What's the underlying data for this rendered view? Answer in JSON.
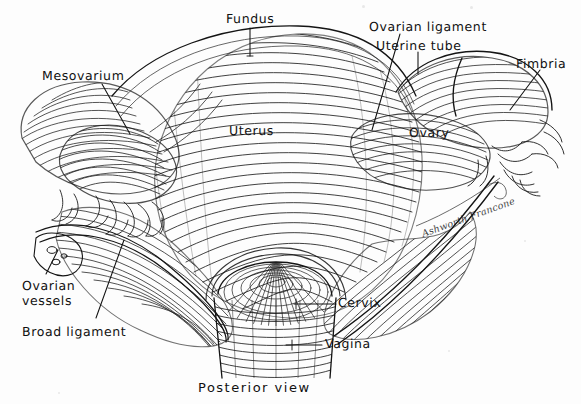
{
  "plate": {
    "title": "Posterior view of uterus, uterine tubes and ovaries",
    "medium": "pen-and-ink anatomical line illustration",
    "ink_color": "#111111",
    "paper_color": "#fdfdfd",
    "width": 581,
    "height": 404
  },
  "caption": {
    "text": "Posterior  view"
  },
  "signature": {
    "text": "Ashworth Francone"
  },
  "labels": [
    {
      "id": "fundus",
      "text": "Fundus",
      "x": 226,
      "y": 12,
      "leader": "vertical-down"
    },
    {
      "id": "mesovarium",
      "text": "Mesovarium",
      "x": 42,
      "y": 69,
      "leader": "diagonal-down-right"
    },
    {
      "id": "ovarian-ligament",
      "text": "Ovarian ligament",
      "x": 369,
      "y": 20,
      "leader": "diagonal-down-left"
    },
    {
      "id": "uterine-tube",
      "text": "Uterine tube",
      "x": 376,
      "y": 39,
      "leader": "vertical-down"
    },
    {
      "id": "fimbria",
      "text": "Fimbria",
      "x": 516,
      "y": 57,
      "leader": "diagonal-down-left"
    },
    {
      "id": "uterus",
      "text": "Uterus",
      "x": 229,
      "y": 124,
      "leader": "none"
    },
    {
      "id": "ovary",
      "text": "Ovary",
      "x": 409,
      "y": 126,
      "leader": "none"
    },
    {
      "id": "ovarian-vessels",
      "text": "Ovarian\nvessels",
      "x": 22,
      "y": 279,
      "leader": "diagonal-up-right"
    },
    {
      "id": "broad-ligament",
      "text": "Broad ligament",
      "x": 22,
      "y": 325,
      "leader": "diagonal-up-right"
    },
    {
      "id": "cervix",
      "text": "Cervix",
      "x": 338,
      "y": 299,
      "leader": "horizontal-left"
    },
    {
      "id": "vagina",
      "text": "Vagina",
      "x": 325,
      "y": 340,
      "leader": "horizontal-left"
    }
  ],
  "structures": [
    {
      "id": "uterus-body",
      "name": "uterus body (corpus)"
    },
    {
      "id": "fundus-region",
      "name": "fundus of uterus"
    },
    {
      "id": "left-uterine-tube",
      "name": "left uterine tube"
    },
    {
      "id": "right-uterine-tube",
      "name": "right uterine tube"
    },
    {
      "id": "left-ovary",
      "name": "left ovary"
    },
    {
      "id": "right-ovary",
      "name": "right ovary"
    },
    {
      "id": "left-fimbriae",
      "name": "left fimbriae"
    },
    {
      "id": "right-fimbriae",
      "name": "right fimbriae"
    },
    {
      "id": "broad-ligament-sheet",
      "name": "broad ligament"
    },
    {
      "id": "cervix-dome",
      "name": "cervix"
    },
    {
      "id": "vagina-cuff",
      "name": "vagina"
    }
  ]
}
